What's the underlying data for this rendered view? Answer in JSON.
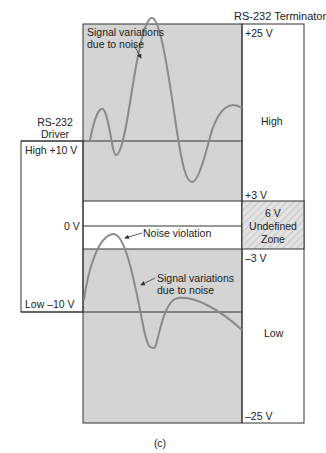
{
  "terminator": {
    "title": "RS-232 Terminator",
    "v_plus25": "+25 V",
    "high": "High",
    "v_plus3": "+3 V",
    "undefined_1": "6 V",
    "undefined_2": "Undefined",
    "undefined_3": "Zone",
    "v_minus3": "–3 V",
    "low": "Low",
    "v_minus25": "–25 V"
  },
  "driver": {
    "title_1": "RS-232",
    "title_2": "Driver",
    "high": "High  +10 V",
    "zero": "0 V",
    "low": "Low  –10 V"
  },
  "annotations": {
    "top_noise_1": "Signal variations",
    "top_noise_2": "due to noise",
    "noise_violation": "Noise violation",
    "bottom_noise_1": "Signal variations",
    "bottom_noise_2": "due to noise"
  },
  "caption": "(c)",
  "colors": {
    "shade": "#d4d4d4",
    "line": "#333333",
    "signal": "#8a8a8a",
    "hatch": "#bdbdbd"
  }
}
